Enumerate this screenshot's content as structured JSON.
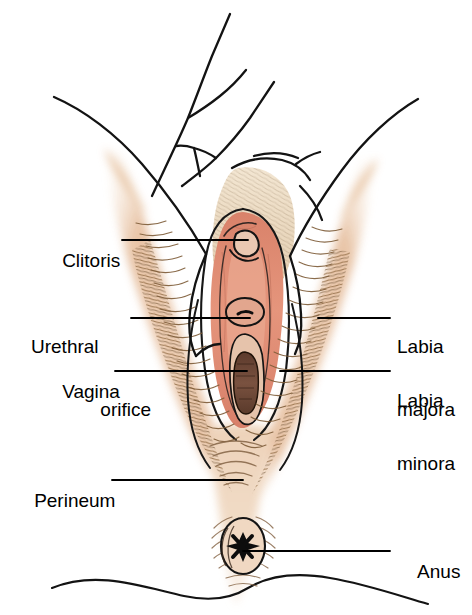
{
  "figure": {
    "type": "anatomical-line-drawing",
    "background_color": "#ffffff"
  },
  "palette": {
    "skin": "#e9c6aa",
    "skin_light": "#f2dcc6",
    "skin_deep": "#dfa984",
    "vestibule_pink": "#e08a70",
    "vestibule_pink_light": "#eaa890",
    "inner_flesh": "#d98b72",
    "hair_brown": "#a87c52",
    "hair_dark": "#6f5334",
    "opening_dark": "#6b4330",
    "outline": "#111111",
    "leader": "#000000",
    "text": "#000000"
  },
  "labels": [
    {
      "id": "clitoris",
      "text": "Clitoris",
      "text2": "",
      "side": "left",
      "x": 41,
      "y": 229,
      "leader": {
        "x1": 122,
        "y1": 240,
        "x2": 248,
        "y2": 240
      }
    },
    {
      "id": "urethral-orifice",
      "text": "Urethral",
      "text2": "orifice",
      "side": "left",
      "x": 31,
      "y": 294,
      "leader": {
        "x1": 131,
        "y1": 318,
        "x2": 250,
        "y2": 318
      }
    },
    {
      "id": "vagina",
      "text": "Vagina",
      "text2": "",
      "side": "left",
      "x": 41,
      "y": 360,
      "leader": {
        "x1": 115,
        "y1": 371,
        "x2": 247,
        "y2": 371
      }
    },
    {
      "id": "perineum",
      "text": "Perineum",
      "text2": "",
      "side": "left",
      "x": 13,
      "y": 469,
      "leader": {
        "x1": 112,
        "y1": 480,
        "x2": 243,
        "y2": 480
      }
    },
    {
      "id": "labia-majora",
      "text": "Labia",
      "text2": "majora",
      "side": "right",
      "x": 397,
      "y": 294,
      "leader": {
        "x1": 318,
        "y1": 318,
        "x2": 390,
        "y2": 318
      }
    },
    {
      "id": "labia-minora",
      "text": "Labia",
      "text2": "minora",
      "side": "right",
      "x": 397,
      "y": 348,
      "leader": {
        "x1": 280,
        "y1": 371,
        "x2": 390,
        "y2": 371
      }
    },
    {
      "id": "anus",
      "text": "Anus",
      "text2": "",
      "side": "right",
      "x": 397,
      "y": 540,
      "leader": {
        "x1": 243,
        "y1": 551,
        "x2": 390,
        "y2": 551
      }
    }
  ],
  "structures": [
    {
      "name": "mons-pubis",
      "description": "pale rounded prominence above the vulva"
    },
    {
      "name": "labia-majora",
      "description": "outer hair-covered folds flanking the vestibule"
    },
    {
      "name": "labia-minora",
      "description": "inner pink folds surrounding the vestibule"
    },
    {
      "name": "clitoris",
      "description": "small hooded glans at the top of the vestibule"
    },
    {
      "name": "urethral-orifice",
      "description": "small opening below the clitoris"
    },
    {
      "name": "vaginal-opening",
      "description": "dark elongated opening below the urethral orifice"
    },
    {
      "name": "perineum",
      "description": "smooth area between vulva and anus"
    },
    {
      "name": "anus",
      "description": "oval opening with radiating folds and dark star centre"
    },
    {
      "name": "thigh-left",
      "description": "inner thigh contour on the left"
    },
    {
      "name": "thigh-right",
      "description": "inner thigh contour on the right"
    },
    {
      "name": "buttock-contour",
      "description": "wavy line across the bottom of the drawing"
    }
  ]
}
